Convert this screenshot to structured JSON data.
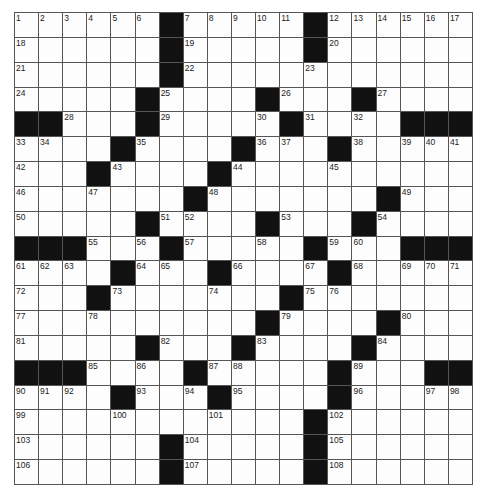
{
  "puzzle": {
    "rows": 19,
    "cols": 19,
    "grid": [
      "......#.....#......",
      "......#.....#......",
      "......#............",
      ".....#....#...#....",
      "##...#.....#....###",
      "....#....#...#.....",
      "...#....#..........",
      ".......#.......#...",
      ".....#....#...#....",
      "###...#.....#...###",
      "....#...#....#.....",
      "...#.......#.......",
      "..........#....#...",
      ".....#...#....#....",
      "###....#.....#...##",
      "....#...#....#.....",
      "............#......",
      "......#.....#......",
      "......#.....#......"
    ],
    "numbers": [
      [
        0,
        0,
        1
      ],
      [
        0,
        1,
        2
      ],
      [
        0,
        2,
        3
      ],
      [
        0,
        3,
        4
      ],
      [
        0,
        4,
        5
      ],
      [
        0,
        5,
        6
      ],
      [
        0,
        7,
        7
      ],
      [
        0,
        8,
        8
      ],
      [
        0,
        9,
        9
      ],
      [
        0,
        10,
        10
      ],
      [
        0,
        11,
        11
      ],
      [
        0,
        13,
        12
      ],
      [
        0,
        14,
        13
      ],
      [
        0,
        15,
        14
      ],
      [
        0,
        16,
        15
      ],
      [
        0,
        17,
        16
      ],
      [
        0,
        18,
        17
      ],
      [
        1,
        0,
        18
      ],
      [
        1,
        7,
        19
      ],
      [
        1,
        13,
        20
      ],
      [
        2,
        0,
        21
      ],
      [
        2,
        7,
        22
      ],
      [
        2,
        12,
        23
      ],
      [
        3,
        0,
        24
      ],
      [
        3,
        6,
        25
      ],
      [
        3,
        11,
        26
      ],
      [
        3,
        15,
        27
      ],
      [
        4,
        2,
        28
      ],
      [
        4,
        6,
        29
      ],
      [
        4,
        10,
        30
      ],
      [
        4,
        12,
        31
      ],
      [
        4,
        14,
        32
      ],
      [
        5,
        0,
        33
      ],
      [
        5,
        1,
        34
      ],
      [
        5,
        5,
        35
      ],
      [
        5,
        10,
        36
      ],
      [
        5,
        11,
        37
      ],
      [
        5,
        14,
        38
      ],
      [
        5,
        16,
        39
      ],
      [
        5,
        17,
        40
      ],
      [
        5,
        18,
        41
      ],
      [
        6,
        0,
        42
      ],
      [
        6,
        4,
        43
      ],
      [
        6,
        9,
        44
      ],
      [
        6,
        13,
        45
      ],
      [
        7,
        0,
        46
      ],
      [
        7,
        3,
        47
      ],
      [
        7,
        8,
        48
      ],
      [
        7,
        16,
        49
      ],
      [
        8,
        0,
        50
      ],
      [
        8,
        6,
        51
      ],
      [
        8,
        7,
        52
      ],
      [
        8,
        11,
        53
      ],
      [
        8,
        15,
        54
      ],
      [
        9,
        3,
        55
      ],
      [
        9,
        5,
        56
      ],
      [
        9,
        7,
        57
      ],
      [
        9,
        10,
        58
      ],
      [
        9,
        13,
        59
      ],
      [
        9,
        14,
        60
      ],
      [
        10,
        0,
        61
      ],
      [
        10,
        1,
        62
      ],
      [
        10,
        2,
        63
      ],
      [
        10,
        5,
        64
      ],
      [
        10,
        6,
        65
      ],
      [
        10,
        9,
        66
      ],
      [
        10,
        12,
        67
      ],
      [
        10,
        14,
        68
      ],
      [
        10,
        16,
        69
      ],
      [
        10,
        17,
        70
      ],
      [
        10,
        18,
        71
      ],
      [
        11,
        0,
        72
      ],
      [
        11,
        4,
        73
      ],
      [
        11,
        8,
        74
      ],
      [
        11,
        12,
        75
      ],
      [
        11,
        13,
        76
      ],
      [
        12,
        0,
        77
      ],
      [
        12,
        3,
        78
      ],
      [
        12,
        11,
        79
      ],
      [
        12,
        16,
        80
      ],
      [
        13,
        0,
        81
      ],
      [
        13,
        6,
        82
      ],
      [
        13,
        10,
        83
      ],
      [
        13,
        15,
        84
      ],
      [
        14,
        3,
        85
      ],
      [
        14,
        5,
        86
      ],
      [
        14,
        8,
        87
      ],
      [
        14,
        9,
        88
      ],
      [
        14,
        14,
        89
      ],
      [
        15,
        0,
        90
      ],
      [
        15,
        1,
        91
      ],
      [
        15,
        2,
        92
      ],
      [
        15,
        5,
        93
      ],
      [
        15,
        7,
        94
      ],
      [
        15,
        9,
        95
      ],
      [
        15,
        14,
        96
      ],
      [
        15,
        17,
        97
      ],
      [
        15,
        18,
        98
      ],
      [
        16,
        0,
        99
      ],
      [
        16,
        4,
        100
      ],
      [
        16,
        8,
        101
      ],
      [
        16,
        13,
        102
      ],
      [
        17,
        0,
        103
      ],
      [
        17,
        7,
        104
      ],
      [
        17,
        13,
        105
      ],
      [
        18,
        0,
        106
      ],
      [
        18,
        7,
        107
      ],
      [
        18,
        13,
        108
      ]
    ],
    "colors": {
      "black_cell": "#111111",
      "white_cell": "#fdfdfd",
      "grid_line": "#555555"
    }
  }
}
